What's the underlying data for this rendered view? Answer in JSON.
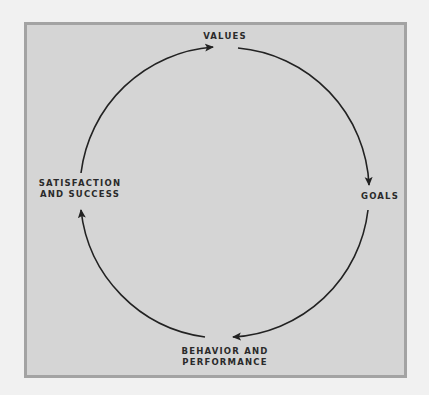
{
  "diagram": {
    "type": "cycle",
    "nodes": [
      {
        "id": "values",
        "label": "VALUES"
      },
      {
        "id": "goals",
        "label": "GOALS"
      },
      {
        "id": "behavior",
        "label_lines": [
          "BEHAVIOR AND",
          "PERFORMANCE"
        ]
      },
      {
        "id": "satisfaction",
        "label_lines": [
          "SATISFACTION",
          "AND SUCCESS"
        ]
      }
    ],
    "edges": [
      {
        "from": "values",
        "to": "goals"
      },
      {
        "from": "goals",
        "to": "behavior"
      },
      {
        "from": "behavior",
        "to": "satisfaction"
      },
      {
        "from": "satisfaction",
        "to": "values"
      }
    ],
    "colors": {
      "page_background": "#f1f1f1",
      "panel_background": "#d5d5d5",
      "panel_border": "#a3a3a3",
      "arrow": "#222222",
      "text": "#2a2a2a"
    }
  }
}
